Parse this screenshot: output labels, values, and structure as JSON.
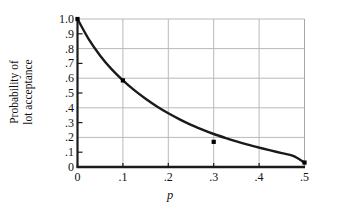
{
  "chart_data": {
    "type": "line",
    "title": "",
    "subtitle": "",
    "xlabel": "p",
    "ylabel": "Probability of lot acceptance",
    "ylabel_lines": [
      "Probability of",
      "lot acceptance"
    ],
    "xlim": [
      0,
      0.5
    ],
    "ylim": [
      0,
      1.0
    ],
    "grid": "major vertical gridlines at each x tick; horizontal gridlines at .2, .4, .6, .8 with short tick stubs at .1, .3, .5, .7, .9",
    "legend": "none",
    "xticks": [
      0,
      0.1,
      0.2,
      0.3,
      0.4,
      0.5
    ],
    "xticklabels": [
      "0",
      ".1",
      ".2",
      ".3",
      ".4",
      ".5"
    ],
    "yticks": [
      0,
      0.1,
      0.2,
      0.3,
      0.4,
      0.5,
      0.6,
      0.7,
      0.8,
      0.9,
      1.0
    ],
    "yticklabels": [
      "0",
      ".1",
      ".2",
      ".3",
      ".4",
      ".5",
      ".6",
      ".7",
      ".8",
      ".9",
      "1.0"
    ],
    "series": [
      {
        "name": "Probability of lot acceptance",
        "marker": "filled-square",
        "color": "#1a1a1a",
        "x": [
          0,
          0.1,
          0.3,
          0.5
        ],
        "values": [
          1.0,
          0.585,
          0.17,
          0.03
        ],
        "curve_x": [
          0,
          0.025,
          0.05,
          0.075,
          0.1,
          0.125,
          0.15,
          0.175,
          0.2,
          0.225,
          0.25,
          0.275,
          0.3,
          0.325,
          0.35,
          0.375,
          0.4,
          0.425,
          0.45,
          0.475,
          0.5
        ],
        "curve_y": [
          1.0,
          0.862,
          0.752,
          0.661,
          0.585,
          0.519,
          0.461,
          0.409,
          0.363,
          0.322,
          0.285,
          0.253,
          0.223,
          0.197,
          0.173,
          0.151,
          0.131,
          0.112,
          0.094,
          0.075,
          0.03
        ]
      }
    ],
    "annotations": []
  },
  "style": {
    "axis_color": "#1a1a1a",
    "grid_color": "#b9b9b9",
    "frame_right_color": "#a8a8a8",
    "curve_color": "#1a1a1a",
    "marker_color": "#000000",
    "background": "#ffffff"
  }
}
